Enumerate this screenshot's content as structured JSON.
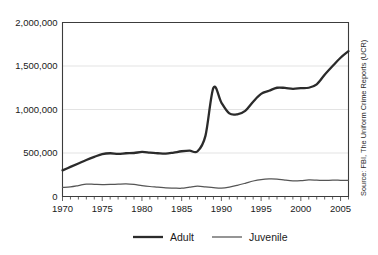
{
  "chart_data": {
    "type": "line",
    "title": "",
    "xlabel": "",
    "ylabel": "",
    "xlim": [
      1970,
      2006
    ],
    "ylim": [
      0,
      2000000
    ],
    "grid": true,
    "legend_position": "bottom-center",
    "y_ticks": [
      0,
      500000,
      1000000,
      1500000,
      2000000
    ],
    "y_tick_labels": [
      "0",
      "500,000",
      "1,000,000",
      "1,500,000",
      "2,000,000"
    ],
    "x_ticks": [
      1970,
      1975,
      1980,
      1985,
      1990,
      1995,
      2000,
      2005
    ],
    "x_tick_labels": [
      "1970",
      "1975",
      "1980",
      "1985",
      "1990",
      "1995",
      "2000",
      "2005"
    ],
    "x_minor_tick_interval": 1,
    "x": [
      1970,
      1971,
      1972,
      1973,
      1974,
      1975,
      1976,
      1977,
      1978,
      1979,
      1980,
      1981,
      1982,
      1983,
      1984,
      1985,
      1986,
      1987,
      1988,
      1989,
      1990,
      1991,
      1992,
      1993,
      1994,
      1995,
      1996,
      1997,
      1998,
      1999,
      2000,
      2001,
      2002,
      2003,
      2004,
      2005,
      2006
    ],
    "series": [
      {
        "name": "Adult",
        "values": [
          300000,
          340000,
          380000,
          420000,
          455000,
          487000,
          497000,
          490000,
          497000,
          500000,
          512000,
          505000,
          497000,
          492000,
          505000,
          520000,
          527000,
          520000,
          700000,
          1250000,
          1080000,
          955000,
          945000,
          985000,
          1090000,
          1180000,
          1215000,
          1250000,
          1248000,
          1238000,
          1245000,
          1250000,
          1290000,
          1400000,
          1500000,
          1595000,
          1670000
        ]
      },
      {
        "name": "Juvenile",
        "values": [
          105000,
          110000,
          125000,
          143000,
          140000,
          137000,
          138000,
          142000,
          145000,
          138000,
          125000,
          115000,
          108000,
          100000,
          97000,
          95000,
          108000,
          118000,
          110000,
          102000,
          97000,
          108000,
          128000,
          152000,
          178000,
          195000,
          202000,
          200000,
          188000,
          180000,
          182000,
          190000,
          188000,
          184000,
          188000,
          186000,
          184000
        ]
      }
    ],
    "annotations": {
      "source": "Source: FBI, The Uniform Crime Reports (UCR)"
    }
  },
  "legend": {
    "items": [
      {
        "label": "Adult"
      },
      {
        "label": "Juvenile"
      }
    ]
  },
  "source_note": "Source: FBI, The Uniform Crime Reports (UCR)"
}
